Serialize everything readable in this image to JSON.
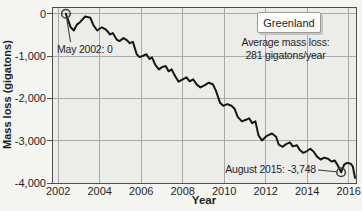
{
  "colors": {
    "line": "#161616",
    "plot_bg": "#ecece9",
    "grid": "#a9a9a7",
    "frame": "#4f4f4f",
    "page_bg": "#f5f5f2",
    "text": "#1f1f1f",
    "legend_bg": "#fdfdfb",
    "legend_border": "#9b9b99",
    "annotation": "#3c3c3c"
  },
  "chart_data": {
    "type": "line",
    "title": "",
    "xlabel": "Year",
    "ylabel": "Mass loss (gigatons)",
    "xlim": [
      2001.7,
      2016.35
    ],
    "ylim": [
      -4000,
      160
    ],
    "xticks": [
      2002,
      2004,
      2006,
      2008,
      2010,
      2012,
      2014,
      2016
    ],
    "yticks": [
      0,
      -1000,
      -2000,
      -3000,
      -4000
    ],
    "ytick_labels": [
      "0",
      "-1,000",
      "-2,000",
      "-3,000",
      "-4,000"
    ],
    "grid": true,
    "legend": {
      "label": "Greenland",
      "position": "top-right"
    },
    "notes": [
      "Average mass loss:",
      "281 gigatons/year"
    ],
    "annotations": [
      {
        "text": "May 2002: 0",
        "point": [
          2002.37,
          0
        ]
      },
      {
        "text": "August 2015: -3,748",
        "point": [
          2015.63,
          -3748
        ]
      }
    ],
    "series": [
      {
        "name": "Greenland ice sheet cumulative mass change (gigatons)",
        "points": [
          [
            2002.37,
            0
          ],
          [
            2002.6,
            -320
          ],
          [
            2002.75,
            -395
          ],
          [
            2002.9,
            -255
          ],
          [
            2003.05,
            -200
          ],
          [
            2003.3,
            -65
          ],
          [
            2003.55,
            -95
          ],
          [
            2003.7,
            -275
          ],
          [
            2003.88,
            -395
          ],
          [
            2004.1,
            -320
          ],
          [
            2004.3,
            -375
          ],
          [
            2004.5,
            -490
          ],
          [
            2004.63,
            -455
          ],
          [
            2004.82,
            -610
          ],
          [
            2004.95,
            -645
          ],
          [
            2005.15,
            -575
          ],
          [
            2005.32,
            -630
          ],
          [
            2005.45,
            -695
          ],
          [
            2005.6,
            -665
          ],
          [
            2005.78,
            -955
          ],
          [
            2005.92,
            -1025
          ],
          [
            2006.1,
            -990
          ],
          [
            2006.25,
            -955
          ],
          [
            2006.4,
            -1070
          ],
          [
            2006.52,
            -1030
          ],
          [
            2006.68,
            -1205
          ],
          [
            2006.85,
            -1315
          ],
          [
            2007.0,
            -1260
          ],
          [
            2007.18,
            -1235
          ],
          [
            2007.32,
            -1360
          ],
          [
            2007.47,
            -1315
          ],
          [
            2007.6,
            -1445
          ],
          [
            2007.8,
            -1605
          ],
          [
            2008.0,
            -1550
          ],
          [
            2008.18,
            -1505
          ],
          [
            2008.33,
            -1595
          ],
          [
            2008.5,
            -1550
          ],
          [
            2008.68,
            -1675
          ],
          [
            2008.85,
            -1740
          ],
          [
            2009.05,
            -1690
          ],
          [
            2009.25,
            -1630
          ],
          [
            2009.45,
            -1665
          ],
          [
            2009.6,
            -1815
          ],
          [
            2009.8,
            -2105
          ],
          [
            2009.95,
            -2175
          ],
          [
            2010.15,
            -2135
          ],
          [
            2010.35,
            -2175
          ],
          [
            2010.5,
            -2245
          ],
          [
            2010.65,
            -2435
          ],
          [
            2010.85,
            -2545
          ],
          [
            2011.05,
            -2505
          ],
          [
            2011.2,
            -2470
          ],
          [
            2011.35,
            -2585
          ],
          [
            2011.5,
            -2545
          ],
          [
            2011.65,
            -2875
          ],
          [
            2011.82,
            -2995
          ],
          [
            2012.05,
            -2885
          ],
          [
            2012.3,
            -2830
          ],
          [
            2012.5,
            -2905
          ],
          [
            2012.63,
            -3095
          ],
          [
            2012.82,
            -3145
          ],
          [
            2013.0,
            -3075
          ],
          [
            2013.17,
            -3040
          ],
          [
            2013.3,
            -3135
          ],
          [
            2013.5,
            -3110
          ],
          [
            2013.63,
            -3215
          ],
          [
            2013.8,
            -3285
          ],
          [
            2013.97,
            -3250
          ],
          [
            2014.15,
            -3190
          ],
          [
            2014.3,
            -3255
          ],
          [
            2014.47,
            -3375
          ],
          [
            2014.65,
            -3445
          ],
          [
            2014.82,
            -3400
          ],
          [
            2015.0,
            -3425
          ],
          [
            2015.17,
            -3495
          ],
          [
            2015.32,
            -3465
          ],
          [
            2015.47,
            -3580
          ],
          [
            2015.63,
            -3748
          ],
          [
            2015.78,
            -3565
          ],
          [
            2015.92,
            -3525
          ],
          [
            2016.1,
            -3545
          ],
          [
            2016.2,
            -3615
          ],
          [
            2016.3,
            -3880
          ]
        ]
      }
    ]
  }
}
